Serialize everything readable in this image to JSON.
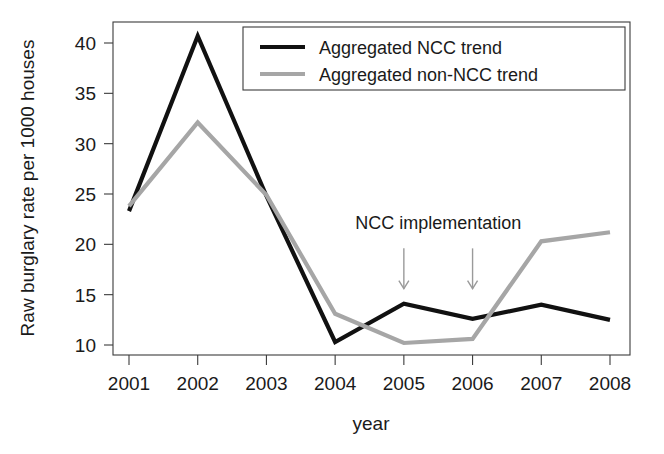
{
  "chart_data": {
    "type": "line",
    "title": "",
    "xlabel": "year",
    "ylabel": "Raw burglary rate per 1000 houses",
    "categories": [
      "2001",
      "2002",
      "2003",
      "2004",
      "2005",
      "2006",
      "2007",
      "2008"
    ],
    "x": [
      2001,
      2002,
      2003,
      2004,
      2005,
      2006,
      2007,
      2008
    ],
    "xlim": [
      2001,
      2008
    ],
    "ylim": [
      9.5,
      41.5
    ],
    "yticks": [
      10,
      15,
      20,
      25,
      30,
      35,
      40
    ],
    "xticks": [
      "2001",
      "2002",
      "2003",
      "2004",
      "2005",
      "2006",
      "2007",
      "2008"
    ],
    "grid": false,
    "legend_position": "top-right",
    "series": [
      {
        "name": "Aggregated NCC trend",
        "color": "#111111",
        "width": 4.2,
        "values": [
          23.3,
          40.7,
          24.8,
          10.3,
          14.1,
          12.6,
          14.0,
          12.5
        ]
      },
      {
        "name": "Aggregated non-NCC trend",
        "color": "#a6a6a6",
        "width": 4.2,
        "values": [
          23.8,
          32.1,
          24.9,
          13.1,
          10.2,
          10.6,
          20.3,
          21.2
        ]
      }
    ],
    "annotations": [
      {
        "text": "NCC implementation",
        "text_x": 2005.5,
        "text_y": 21.5,
        "arrows": [
          {
            "x": 2005,
            "y_from": 19.6,
            "y_to": 15.6
          },
          {
            "x": 2006,
            "y_from": 19.6,
            "y_to": 15.6
          }
        ]
      }
    ]
  }
}
